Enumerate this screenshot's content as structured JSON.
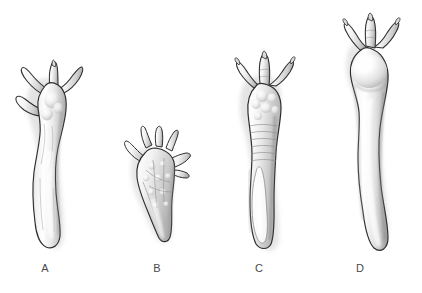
{
  "figure": {
    "type": "comparative-anatomical-illustration",
    "background_color": "#ffffff",
    "width": 422,
    "height": 293,
    "style": "grayscale airbrush / pencil shaded line drawing",
    "outline_color": "#2b2b2b",
    "label_color": "#4a4a4a",
    "shade_light": "#fdfdfd",
    "shade_mid": "#d2d2d2",
    "shade_dark": "#9a9a9a",
    "shadow_color": "#bfbfbf"
  },
  "specimens": [
    {
      "label": "A",
      "digit_count": 4,
      "relative_height": "medium-tall",
      "relative_width": "medium",
      "shaft": "slender, tapering, gently curved, widening to a blunt rounded distal end",
      "surface_texture": "rounded bulbous pads at digit bases, faint longitudinal striations on shaft",
      "label_x": 45,
      "label_y": 268,
      "bbox": [
        14,
        62,
        78,
        250
      ]
    },
    {
      "label": "B",
      "digit_count": 5,
      "relative_height": "shortest",
      "relative_width": "broadest",
      "shaft": "very short and stubby, triangular, tapering to a narrow rounded base",
      "surface_texture": "heavily textured palm with numerous small circular nodules and branching grooves",
      "label_x": 157,
      "label_y": 268,
      "bbox": [
        118,
        125,
        82,
        235
      ]
    },
    {
      "label": "C",
      "digit_count": 3,
      "relative_height": "tall",
      "relative_width": "medium",
      "shaft": "thick and straight, with transverse ridges above and an elongated oval groove in the lower half",
      "surface_texture": "clustered rounded tubercles at digit bases, horizontal banding on upper shaft",
      "label_x": 258,
      "label_y": 268,
      "bbox": [
        226,
        52,
        80,
        248
      ]
    },
    {
      "label": "D",
      "digit_count": 3,
      "relative_height": "tallest",
      "relative_width": "narrow",
      "shaft": "very long, smooth, slightly sinuous, expanding to a blunt rounded distal end",
      "surface_texture": "smooth bulbous rounded head, unornamented glossy shaft",
      "label_x": 360,
      "label_y": 268,
      "bbox": [
        334,
        14,
        78,
        244
      ]
    }
  ]
}
